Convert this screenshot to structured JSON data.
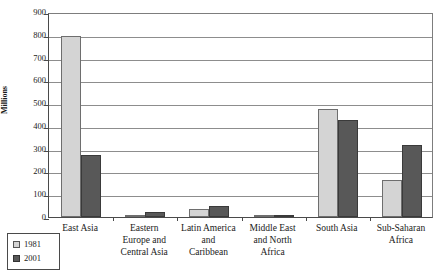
{
  "chart_data": {
    "type": "bar",
    "title": "",
    "xlabel": "",
    "ylabel": "Millions",
    "ylim": [
      0,
      900
    ],
    "ytick_step": 100,
    "yticks": [
      "900",
      "800",
      "700",
      "600",
      "500",
      "400",
      "300",
      "200",
      "100",
      "0"
    ],
    "grid": true,
    "legend_position": "bottom-left",
    "categories": [
      "East Asia",
      "Eastern\nEurope and\nCentral Asia",
      "Latin America\nand\nCaribbean",
      "Middle East\nand North\nAfrica",
      "South Asia",
      "Sub-Saharan\nAfrica"
    ],
    "category_labels": [
      [
        "East Asia"
      ],
      [
        "Eastern",
        "Europe and",
        "Central Asia"
      ],
      [
        "Latin America",
        "and",
        "Caribbean"
      ],
      [
        "Middle East",
        "and North",
        "Africa"
      ],
      [
        "South Asia"
      ],
      [
        "Sub-Saharan",
        "Africa"
      ]
    ],
    "series": [
      {
        "name": "1981",
        "color": "#d4d4d4",
        "values": [
          796,
          3,
          36,
          9,
          475,
          164
        ]
      },
      {
        "name": "2001",
        "color": "#585858",
        "values": [
          271,
          20,
          50,
          7,
          428,
          316
        ]
      }
    ]
  },
  "legend": {
    "entries": [
      {
        "label": "1981",
        "swatch": "light-gray"
      },
      {
        "label": "2001",
        "swatch": "dark-gray"
      }
    ]
  }
}
